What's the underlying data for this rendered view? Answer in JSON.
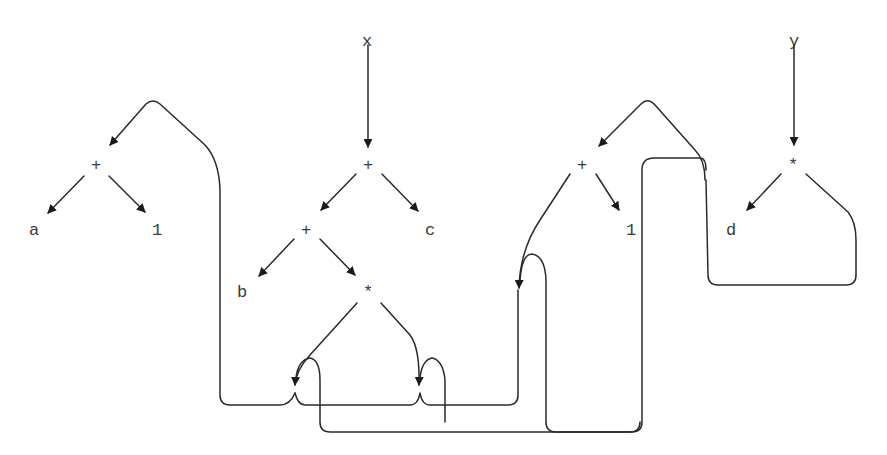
{
  "diagram": {
    "type": "expression-dag",
    "colors": {
      "stroke": "#2a2a2a",
      "text": "#3a3a3a",
      "background": "#ffffff"
    },
    "nodes": {
      "x": {
        "label": "x",
        "x": 368,
        "y": 40
      },
      "y": {
        "label": "y",
        "x": 795,
        "y": 40
      },
      "plus_a1": {
        "label": "+",
        "x": 97,
        "y": 165
      },
      "a": {
        "label": "a",
        "x": 35,
        "y": 230
      },
      "one_1": {
        "label": "1",
        "x": 158,
        "y": 230
      },
      "plus_x": {
        "label": "+",
        "x": 369,
        "y": 165
      },
      "plus_b": {
        "label": "+",
        "x": 307,
        "y": 230
      },
      "c": {
        "label": "c",
        "x": 431,
        "y": 230
      },
      "b": {
        "label": "b",
        "x": 243,
        "y": 292
      },
      "star_1": {
        "label": "*",
        "x": 369,
        "y": 292
      },
      "plus_12": {
        "label": "+",
        "x": 583,
        "y": 165
      },
      "one_2": {
        "label": "1",
        "x": 632,
        "y": 230
      },
      "star_y": {
        "label": "*",
        "x": 794,
        "y": 165
      },
      "d": {
        "label": "d",
        "x": 732,
        "y": 230
      }
    },
    "edges": [
      {
        "from": "x",
        "to": "plus_x"
      },
      {
        "from": "y",
        "to": "star_y"
      },
      {
        "from": "plus_a1",
        "to": "a"
      },
      {
        "from": "plus_a1",
        "to": "one_1"
      },
      {
        "from": "plus_x",
        "to": "plus_b"
      },
      {
        "from": "plus_x",
        "to": "c"
      },
      {
        "from": "plus_b",
        "to": "b"
      },
      {
        "from": "plus_b",
        "to": "star_1"
      },
      {
        "from": "star_1",
        "to": "plus_a1",
        "note": "left operand, shared subexpression"
      },
      {
        "from": "star_1",
        "to": "plus_a1",
        "note": "right operand, shared subexpression"
      },
      {
        "from": "plus_12",
        "to": "one_2"
      },
      {
        "from": "plus_12",
        "to": "plus_a1",
        "note": "shared subexpression"
      },
      {
        "from": "star_y",
        "to": "d"
      },
      {
        "from": "star_y",
        "to": "plus_12",
        "note": "shared subexpression"
      }
    ]
  }
}
